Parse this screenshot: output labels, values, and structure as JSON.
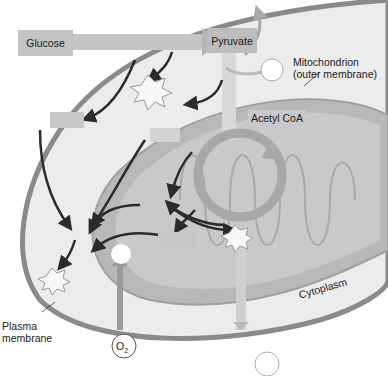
{
  "diagram": {
    "type": "cellular-respiration-overview",
    "labels": {
      "glucose": "Glucose",
      "pyruvate": "Pyruvate",
      "acetyl_coa": "Acetyl CoA",
      "mitochondrion_line1": "Mitochondrion",
      "mitochondrion_line2": "(outer membrane)",
      "cytoplasm": "Cytoplasm",
      "plasma_line1": "Plasma",
      "plasma_line2": "membrane",
      "oxygen": "O",
      "oxygen_sub": "2"
    },
    "colors": {
      "background": "#ffffff",
      "cell_fill": "#ececec",
      "cell_membrane": "#8a8a8a",
      "mito_outer": "#b8b8b8",
      "mito_inner": "#c9c9c9",
      "arrow_dark": "#2b2b2b",
      "arrow_light": "#a8a8a8",
      "box_fill": "#bdbdbd"
    }
  }
}
